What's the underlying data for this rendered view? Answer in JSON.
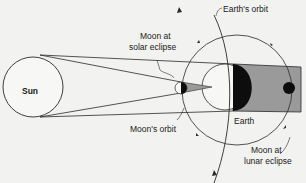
{
  "diagram": {
    "labels": {
      "sun": "Sun",
      "earth": "Earth",
      "earths_orbit": "Earth's orbit",
      "moons_orbit": "Moon's orbit",
      "moon_solar_line1": "Moon at",
      "moon_solar_line2": "solar eclipse",
      "moon_lunar_line1": "Moon at",
      "moon_lunar_line2": "lunar eclipse"
    },
    "colors": {
      "background": "#f2f2f0",
      "line": "#2a2a2a",
      "shadow": "#9a9a9a",
      "body_dark": "#0d0d0d",
      "body_light": "#f7f7f5"
    }
  }
}
